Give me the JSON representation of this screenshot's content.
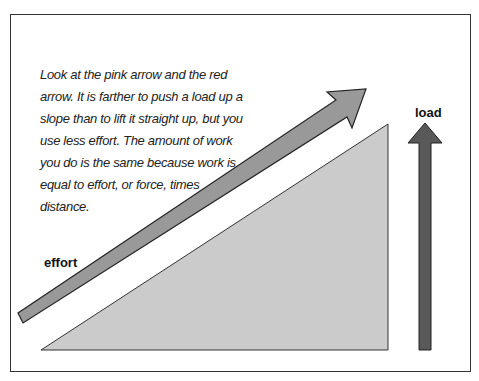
{
  "diagram": {
    "caption": "Look at the pink arrow and the red arrow. It is farther to push a load up a slope than to lift it straight up, but you use less effort. The amount of work you do is the same because work is equal to effort, or force, times distance.",
    "labels": {
      "effort": "effort",
      "load": "load"
    },
    "colors": {
      "slope": "#cbcbcb",
      "effort_arrow": "#999999",
      "load_arrow": "#595959",
      "outline": "#333333"
    }
  }
}
